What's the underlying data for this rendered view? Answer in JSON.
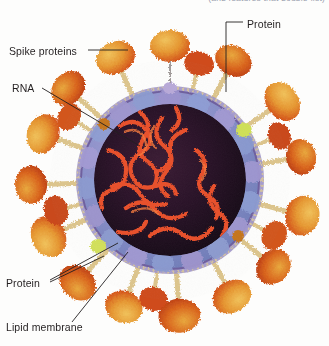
{
  "figure": {
    "header_partial_text": "(and features that double-list)",
    "background_color": "#fdfdfc"
  },
  "labels": {
    "spike_proteins": "Spike proteins",
    "rna": "RNA",
    "protein_top": "Protein",
    "protein_bottom": "Protein",
    "lipid_membrane": "Lipid membrane"
  },
  "colors": {
    "spike_outer": "#e0611f",
    "spike_head_light": "#eaa93b",
    "spike_head_gold": "#d9b14a",
    "spike_stalk": "#e2c98a",
    "nucleocapsid_purple": "#8d84c0",
    "nucleocapsid_blue": "#7f93cc",
    "nucleocapsid_lavender": "#a99dd2",
    "core_dark": "#30172a",
    "core_dark2": "#1d0d1c",
    "rna_orange": "#e8502a",
    "rna_orange_light": "#f2713c",
    "membrane_band": "#5b4a86",
    "accent_chartreuse": "#d2e05a",
    "label_text": "#231f20",
    "leader_line": "#231f20",
    "header_text": "#9aa0ae"
  },
  "structures": [
    {
      "name": "spike-protein",
      "role": "surface glycoprotein, mushroom shaped, radiating outward",
      "count_visible": 22
    },
    {
      "name": "lipid-membrane",
      "role": "outer bilayer envelope with embedded stalks"
    },
    {
      "name": "nucleocapsid-protein",
      "role": "purple and blue ring of protein subunits inside envelope"
    },
    {
      "name": "rna-genome",
      "role": "orange single-stranded coiled genome in dark core"
    },
    {
      "name": "membrane-protein",
      "role": "small proteins embedded in the lipid envelope"
    }
  ],
  "leaders": [
    {
      "from": "spike_proteins",
      "to": "spike head at upper left of virion"
    },
    {
      "from": "rna",
      "to": "orange genome strand in core"
    },
    {
      "from": "protein_top",
      "to": "membrane protein at top of envelope"
    },
    {
      "from": "protein_bottom",
      "to": "chartreuse protein patch in lower-left envelope"
    },
    {
      "from": "lipid_membrane",
      "to": "envelope bilayer at lower-left"
    }
  ]
}
